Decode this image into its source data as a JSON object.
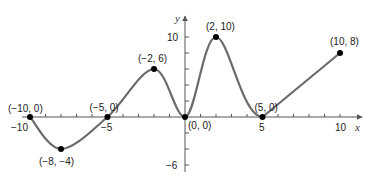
{
  "chart_data": {
    "type": "line",
    "title": "",
    "xlabel": "x",
    "ylabel": "y",
    "xlim": [
      -10,
      11
    ],
    "ylim": [
      -6,
      11
    ],
    "grid": false,
    "x_ticks": [
      -10,
      -5,
      5,
      10
    ],
    "x_tick_labels": [
      "−10",
      "−5",
      "5",
      "10"
    ],
    "y_ticks": [
      10,
      -6
    ],
    "y_tick_labels": [
      "10",
      "−6"
    ],
    "series": [
      {
        "name": "f",
        "points": [
          {
            "x": -10,
            "y": 0,
            "label": "(−10, 0)"
          },
          {
            "x": -8,
            "y": -4,
            "label": "(−8, −4)"
          },
          {
            "x": -5,
            "y": 0,
            "label": "(−5, 0)"
          },
          {
            "x": -2,
            "y": 6,
            "label": "(−2, 6)"
          },
          {
            "x": 0,
            "y": 0,
            "label": "(0, 0)"
          },
          {
            "x": 2,
            "y": 10,
            "label": "(2, 10)"
          },
          {
            "x": 5,
            "y": 0,
            "label": "(5, 0)"
          },
          {
            "x": 10,
            "y": 8,
            "label": "(10, 8)"
          }
        ]
      }
    ],
    "colors": {
      "curve": "#6b6b6b",
      "axis": "#555555",
      "point": "#000000"
    }
  }
}
